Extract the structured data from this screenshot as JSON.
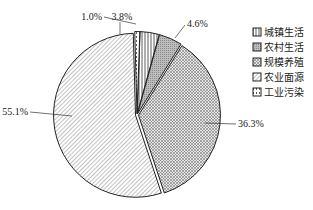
{
  "chart_data": {
    "type": "pie",
    "title": "",
    "categories": [
      "城镇生活",
      "农村生活",
      "规模养殖",
      "农业面源",
      "工业污染"
    ],
    "values": [
      3.8,
      4.6,
      36.3,
      55.1,
      1.0
    ],
    "labels": [
      "3.8%",
      "4.6%",
      "36.3%",
      "55.1%",
      "1.0%"
    ],
    "legend_position": "right",
    "patterns": [
      "vertical-lines",
      "gray-dots",
      "crosshatch",
      "diagonal-lines",
      "dashed"
    ]
  },
  "legend": {
    "items": [
      {
        "label": "城镇生活",
        "pattern": "vertical-lines"
      },
      {
        "label": "农村生活",
        "pattern": "gray-dots"
      },
      {
        "label": "规模养殖",
        "pattern": "crosshatch"
      },
      {
        "label": "农业面源",
        "pattern": "diagonal-lines"
      },
      {
        "label": "工业污染",
        "pattern": "dashed"
      }
    ]
  },
  "colors": {
    "stroke": "#222222",
    "background": "#ffffff"
  }
}
